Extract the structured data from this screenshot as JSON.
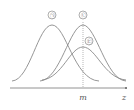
{
  "diagram": {
    "type": "normal-distribution-curves",
    "curves": [
      {
        "label": "㉠",
        "mean_x": 52,
        "peak_y": 25,
        "sigma": 13
      },
      {
        "label": "㉡",
        "mean_x": 83,
        "peak_y": 25,
        "sigma": 13
      },
      {
        "label": "㉢",
        "mean_x": 83,
        "peak_y": 47,
        "sigma": 17
      }
    ],
    "axis": {
      "x_label": "z",
      "marker_label": "m"
    }
  }
}
